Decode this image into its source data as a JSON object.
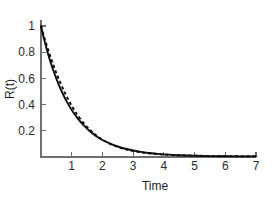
{
  "chart_data": {
    "type": "line",
    "title": "",
    "xlabel": "Time",
    "ylabel": "R(t)",
    "xlim": [
      0,
      7
    ],
    "ylim": [
      0,
      1.05
    ],
    "xticks": [
      1,
      2,
      3,
      4,
      5,
      6,
      7
    ],
    "xtick_labels": [
      "1",
      "2",
      "3",
      "4",
      "5",
      "6",
      "7"
    ],
    "yticks": [
      0.2,
      0.4,
      0.6,
      0.8,
      1
    ],
    "ytick_labels": [
      "0.2",
      "0.4",
      "0.6",
      "0.8",
      "1"
    ],
    "grid": false,
    "legend": "none",
    "colors": {
      "series": "#0d0d0d",
      "axis": "#6e6e6e",
      "text": "#1c1c1c",
      "background": "#ffffff"
    },
    "series": [
      {
        "name": "solid-curve",
        "style": "solid",
        "x": [
          0,
          0.1,
          0.2,
          0.3,
          0.4,
          0.5,
          0.6,
          0.7,
          0.8,
          0.9,
          1.0,
          1.2,
          1.4,
          1.6,
          1.8,
          2.0,
          2.25,
          2.5,
          2.75,
          3.0,
          3.25,
          3.5,
          3.75,
          4.0,
          4.5,
          5.0,
          5.5,
          6.0,
          6.5,
          7.0
        ],
        "y": [
          1.0,
          0.9,
          0.812,
          0.733,
          0.662,
          0.598,
          0.54,
          0.488,
          0.44,
          0.398,
          0.359,
          0.293,
          0.239,
          0.195,
          0.159,
          0.13,
          0.102,
          0.08,
          0.063,
          0.05,
          0.039,
          0.031,
          0.025,
          0.02,
          0.013,
          0.009,
          0.007,
          0.006,
          0.005,
          0.005
        ]
      },
      {
        "name": "dashed-curve",
        "style": "dashed",
        "x": [
          0,
          0.1,
          0.2,
          0.3,
          0.4,
          0.5,
          0.6,
          0.7,
          0.8,
          0.9,
          1.0,
          1.1,
          1.2,
          1.4,
          1.6,
          1.8,
          2.0,
          2.25,
          2.5,
          2.75,
          3.0,
          3.25,
          3.5,
          3.75,
          4.0,
          4.5,
          5.0,
          5.5,
          6.0,
          6.5,
          7.0
        ],
        "y": [
          1.0,
          0.918,
          0.842,
          0.771,
          0.704,
          0.641,
          0.583,
          0.529,
          0.479,
          0.433,
          0.391,
          0.352,
          0.317,
          0.256,
          0.206,
          0.165,
          0.132,
          0.101,
          0.077,
          0.059,
          0.046,
          0.036,
          0.029,
          0.023,
          0.019,
          0.013,
          0.01,
          0.008,
          0.007,
          0.006,
          0.006
        ]
      }
    ]
  },
  "axes": {
    "y_label_text": "R(t)",
    "x_label_text": "Time"
  }
}
